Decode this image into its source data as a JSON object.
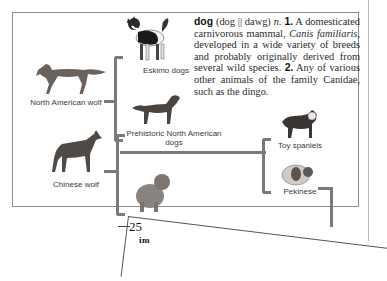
{
  "definition": {
    "headword": "dog",
    "pronunciation": "(dog || dawg)",
    "pos": "n.",
    "sense1_num": "1.",
    "sense1_a": "A domesticated carnivorous mammal,",
    "sense1_sci": "Canis familiaris,",
    "sense1_b": "developed in a wide variety of breeds and probably originally derived from several wild species.",
    "sense2_num": "2.",
    "sense2": "Any of various other animals of the family Canidae, such as the dingo."
  },
  "tree": {
    "north_american_wolf": "North American wolf",
    "eskimo_dogs": "Eskimo dogs",
    "prehistoric_dogs": "Prehistoric North American dogs",
    "chinese_wolf": "Chinese wolf",
    "toy_spaniels": "Toy spaniels",
    "pekinese": "Pekinese"
  },
  "page": {
    "number": "25",
    "partial_word": "im"
  },
  "colors": {
    "bracket": "#7a7a7a",
    "frame": "#8c8c8c",
    "text": "#2a2a2a"
  }
}
